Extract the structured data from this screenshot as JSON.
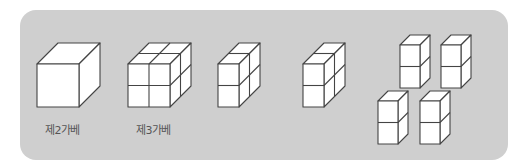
{
  "figures": {
    "cube_2": {
      "label": "제2가베",
      "description": "single large cube"
    },
    "cube_3": {
      "label": "제3가베",
      "description": "cube divided into 2x2x2 small cubes"
    },
    "split_a": {
      "description": "half of 2x2x2 cube: 1 wide, 2 high, 2 deep"
    },
    "split_b": {
      "description": "half of 2x2x2 cube: 1 wide, 2 high, 2 deep"
    },
    "split_c": {
      "description": "four columns of 2 stacked cubes"
    }
  },
  "colors": {
    "panel": "#cfcfcf",
    "face": "#ffffff",
    "stroke": "#444444",
    "label": "#555555"
  }
}
